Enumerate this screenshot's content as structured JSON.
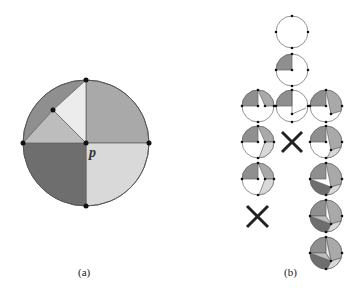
{
  "figure": {
    "panel_a": {
      "label": "(a)",
      "point_label": "p",
      "center": [
        86,
        143
      ],
      "radius": 63,
      "regions": [
        {
          "name": "top-right-quadrant",
          "color": "#a9a9a9"
        },
        {
          "name": "bottom-right-quadrant",
          "color": "#d9d9d9"
        },
        {
          "name": "bottom-left-quadrant",
          "color": "#6e6e6e"
        },
        {
          "name": "top-left-outer-wedge",
          "color": "#8f8f8f"
        },
        {
          "name": "top-left-light-triangle",
          "color": "#ececec"
        },
        {
          "name": "top-left-mid-triangle",
          "color": "#bdbdbd"
        }
      ],
      "vertices": [
        "top",
        "left",
        "right",
        "bottom",
        "center-p",
        "inner-point"
      ]
    },
    "panel_b": {
      "label": "(b)",
      "cells": [
        {
          "row": 0,
          "col": 1,
          "type": "circle",
          "state": "empty"
        },
        {
          "row": 1,
          "col": 1,
          "type": "circle",
          "state": "one-quadrant"
        },
        {
          "row": 2,
          "col": 0,
          "type": "circle",
          "state": "quadrant+wedge-A"
        },
        {
          "row": 2,
          "col": 1,
          "type": "circle",
          "state": "quadrant+segment"
        },
        {
          "row": 2,
          "col": 2,
          "type": "circle",
          "state": "quadrant+wedge-B"
        },
        {
          "row": 3,
          "col": 0,
          "type": "circle",
          "state": "three-regions"
        },
        {
          "row": 3,
          "col": 1,
          "type": "cross",
          "state": "rejected"
        },
        {
          "row": 3,
          "col": 2,
          "type": "circle",
          "state": "three-regions"
        },
        {
          "row": 4,
          "col": 0,
          "type": "circle",
          "state": "three-regions-alt"
        },
        {
          "row": 4,
          "col": 2,
          "type": "circle",
          "state": "four-regions"
        },
        {
          "row": 5,
          "col": 0,
          "type": "cross",
          "state": "rejected"
        },
        {
          "row": 5,
          "col": 2,
          "type": "circle",
          "state": "five-regions"
        },
        {
          "row": 6,
          "col": 2,
          "type": "circle",
          "state": "full"
        }
      ]
    }
  },
  "colors": {
    "outline": "#555555",
    "dot": "#111111",
    "dark": "#6e6e6e",
    "mid": "#8f8f8f",
    "gray": "#a9a9a9",
    "light": "#d9d9d9",
    "lighter": "#ececec",
    "cross": "#222222"
  }
}
